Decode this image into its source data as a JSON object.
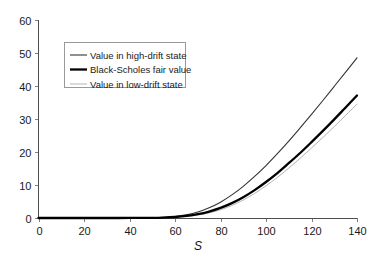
{
  "chart_data": {
    "type": "line",
    "title": "",
    "xlabel": "S",
    "ylabel": "",
    "xlim": [
      0,
      140
    ],
    "ylim": [
      0,
      60
    ],
    "xticks": [
      0,
      20,
      40,
      60,
      80,
      100,
      120,
      140
    ],
    "yticks": [
      0,
      10,
      20,
      30,
      40,
      50,
      60
    ],
    "grid": false,
    "legend_position": "upper-left-inside",
    "x": [
      0,
      10,
      20,
      30,
      40,
      50,
      55,
      60,
      65,
      70,
      75,
      80,
      85,
      90,
      95,
      100,
      105,
      110,
      115,
      120,
      125,
      130,
      135,
      140
    ],
    "series": [
      {
        "name": "Value in high-drift state",
        "color": "#333333",
        "width": 1.1,
        "values": [
          0,
          0,
          0,
          0,
          0.02,
          0.1,
          0.2,
          0.45,
          0.95,
          1.8,
          3.1,
          4.8,
          7.0,
          9.6,
          12.6,
          15.9,
          19.5,
          23.3,
          27.3,
          31.4,
          35.6,
          39.9,
          44.2,
          48.5
        ]
      },
      {
        "name": "Black-Scholes fair value",
        "color": "#000000",
        "width": 2.3,
        "values": [
          0,
          0,
          0,
          0,
          0.01,
          0.06,
          0.13,
          0.3,
          0.62,
          1.15,
          1.95,
          3.05,
          4.5,
          6.3,
          8.45,
          10.9,
          13.6,
          16.6,
          19.7,
          23.0,
          26.4,
          29.9,
          33.5,
          37.1
        ]
      },
      {
        "name": "Value in low-drift state",
        "color": "#b3b3b3",
        "width": 1.0,
        "values": [
          0,
          0,
          0,
          0,
          0.005,
          0.04,
          0.09,
          0.21,
          0.45,
          0.88,
          1.55,
          2.5,
          3.8,
          5.45,
          7.45,
          9.75,
          12.3,
          15.1,
          18.1,
          21.2,
          24.4,
          27.7,
          31.1,
          34.5
        ]
      }
    ]
  },
  "legend": {
    "entries": [
      {
        "label": "Value in high-drift state",
        "swatch": "thin-dark-line"
      },
      {
        "label": "Black-Scholes fair value",
        "swatch": "thick-black-line"
      },
      {
        "label": "Value in low-drift state",
        "swatch": "thin-gray-line"
      }
    ]
  },
  "axes": {
    "x_title": "S",
    "x_tick_labels": [
      "0",
      "20",
      "40",
      "60",
      "80",
      "100",
      "120",
      "140"
    ],
    "y_tick_labels": [
      "0",
      "10",
      "20",
      "30",
      "40",
      "50",
      "60"
    ]
  }
}
